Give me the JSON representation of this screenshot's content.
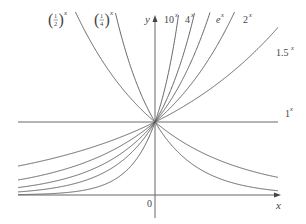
{
  "chart_data": {
    "type": "line",
    "title": "",
    "xlabel": "x",
    "ylabel": "y",
    "origin_label": "0",
    "xlim": [
      -2.2,
      2.0
    ],
    "ylim": [
      0,
      2.5
    ],
    "grid": false,
    "legend": "inline labels at curve ends",
    "series": [
      {
        "name": "(1/2)^x",
        "base": 0.5,
        "label": "(1/2)^x"
      },
      {
        "name": "(1/4)^x",
        "base": 0.25,
        "label": "(1/4)^x"
      },
      {
        "name": "10^x",
        "base": 10,
        "label": "10^x"
      },
      {
        "name": "4^x",
        "base": 4,
        "label": "4^x"
      },
      {
        "name": "e^x",
        "base": 2.718281828,
        "label": "e^x"
      },
      {
        "name": "2^x",
        "base": 2,
        "label": "2^x"
      },
      {
        "name": "1.5^x",
        "base": 1.5,
        "label": "1.5^x"
      },
      {
        "name": "1^x",
        "base": 1,
        "label": "1^x"
      }
    ],
    "annotations": [
      "All curves pass through (0, 1)"
    ]
  },
  "labels": {
    "x_axis": "x",
    "y_axis": "y",
    "origin": "0",
    "half_num": "1",
    "half_den": "2",
    "quarter_num": "1",
    "quarter_den": "4",
    "exp_x": "x",
    "ten": "10",
    "four": "4",
    "e": "e",
    "two": "2",
    "one_five": "1.5",
    "one": "1"
  },
  "colors": {
    "curve": "#555555",
    "axis": "#555555",
    "text": "#444444"
  }
}
